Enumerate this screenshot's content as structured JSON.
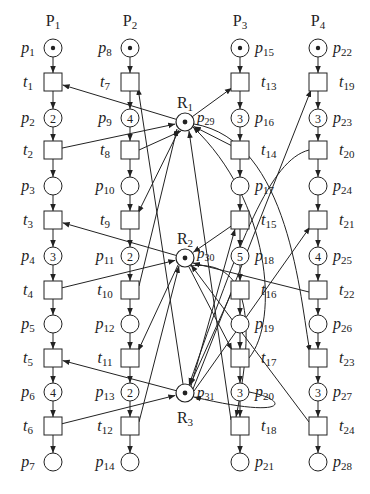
{
  "diagram": {
    "type": "petri-net",
    "processes": [
      {
        "label": "P",
        "sub": "1",
        "x": 53
      },
      {
        "label": "P",
        "sub": "2",
        "x": 130
      },
      {
        "label": "P",
        "sub": "3",
        "x": 240
      },
      {
        "label": "P",
        "sub": "4",
        "x": 318
      }
    ],
    "rows_y": {
      "place": [
        48,
        118,
        186,
        256,
        324,
        392,
        462
      ],
      "trans": [
        82,
        150,
        220,
        290,
        358,
        426
      ]
    },
    "columns": [
      {
        "x": 53,
        "label_side": "left",
        "places": [
          {
            "name": "p",
            "sub": "1",
            "tokens": "dot"
          },
          {
            "name": "p",
            "sub": "2",
            "tokens": "2"
          },
          {
            "name": "p",
            "sub": "3",
            "tokens": ""
          },
          {
            "name": "p",
            "sub": "4",
            "tokens": "3"
          },
          {
            "name": "p",
            "sub": "5",
            "tokens": ""
          },
          {
            "name": "p",
            "sub": "6",
            "tokens": "4"
          },
          {
            "name": "p",
            "sub": "7",
            "tokens": ""
          }
        ],
        "transitions": [
          {
            "name": "t",
            "sub": "1"
          },
          {
            "name": "t",
            "sub": "2"
          },
          {
            "name": "t",
            "sub": "3"
          },
          {
            "name": "t",
            "sub": "4"
          },
          {
            "name": "t",
            "sub": "5"
          },
          {
            "name": "t",
            "sub": "6"
          }
        ]
      },
      {
        "x": 130,
        "label_side": "left",
        "places": [
          {
            "name": "p",
            "sub": "8",
            "tokens": "dot"
          },
          {
            "name": "p",
            "sub": "9",
            "tokens": "4"
          },
          {
            "name": "p",
            "sub": "10",
            "tokens": ""
          },
          {
            "name": "p",
            "sub": "11",
            "tokens": "2"
          },
          {
            "name": "p",
            "sub": "12",
            "tokens": ""
          },
          {
            "name": "p",
            "sub": "13",
            "tokens": "2"
          },
          {
            "name": "p",
            "sub": "14",
            "tokens": ""
          }
        ],
        "transitions": [
          {
            "name": "t",
            "sub": "7"
          },
          {
            "name": "t",
            "sub": "8"
          },
          {
            "name": "t",
            "sub": "9"
          },
          {
            "name": "t",
            "sub": "10"
          },
          {
            "name": "t",
            "sub": "11"
          },
          {
            "name": "t",
            "sub": "12"
          }
        ]
      },
      {
        "x": 240,
        "label_side": "right",
        "places": [
          {
            "name": "p",
            "sub": "15",
            "tokens": "dot"
          },
          {
            "name": "p",
            "sub": "16",
            "tokens": "3"
          },
          {
            "name": "p",
            "sub": "17",
            "tokens": ""
          },
          {
            "name": "p",
            "sub": "18",
            "tokens": "5"
          },
          {
            "name": "p",
            "sub": "19",
            "tokens": ""
          },
          {
            "name": "p",
            "sub": "20",
            "tokens": "3"
          },
          {
            "name": "p",
            "sub": "21",
            "tokens": ""
          }
        ],
        "transitions": [
          {
            "name": "t",
            "sub": "13"
          },
          {
            "name": "t",
            "sub": "14"
          },
          {
            "name": "t",
            "sub": "15"
          },
          {
            "name": "t",
            "sub": "16"
          },
          {
            "name": "t",
            "sub": "17"
          },
          {
            "name": "t",
            "sub": "18"
          }
        ]
      },
      {
        "x": 318,
        "label_side": "right",
        "places": [
          {
            "name": "p",
            "sub": "22",
            "tokens": "dot"
          },
          {
            "name": "p",
            "sub": "23",
            "tokens": "3"
          },
          {
            "name": "p",
            "sub": "24",
            "tokens": ""
          },
          {
            "name": "p",
            "sub": "25",
            "tokens": "4"
          },
          {
            "name": "p",
            "sub": "26",
            "tokens": ""
          },
          {
            "name": "p",
            "sub": "27",
            "tokens": "3"
          },
          {
            "name": "p",
            "sub": "28",
            "tokens": ""
          }
        ],
        "transitions": [
          {
            "name": "t",
            "sub": "19"
          },
          {
            "name": "t",
            "sub": "20"
          },
          {
            "name": "t",
            "sub": "21"
          },
          {
            "name": "t",
            "sub": "22"
          },
          {
            "name": "t",
            "sub": "23"
          },
          {
            "name": "t",
            "sub": "24"
          }
        ]
      }
    ],
    "resources": [
      {
        "label": "R",
        "sub": "1",
        "place": "p",
        "place_sub": "29",
        "x": 185,
        "y": 122,
        "label_pos": "above"
      },
      {
        "label": "R",
        "sub": "2",
        "place": "p",
        "place_sub": "30",
        "x": 185,
        "y": 258,
        "label_pos": "above"
      },
      {
        "label": "R",
        "sub": "3",
        "place": "p",
        "place_sub": "31",
        "x": 185,
        "y": 393,
        "label_pos": "below"
      }
    ]
  }
}
